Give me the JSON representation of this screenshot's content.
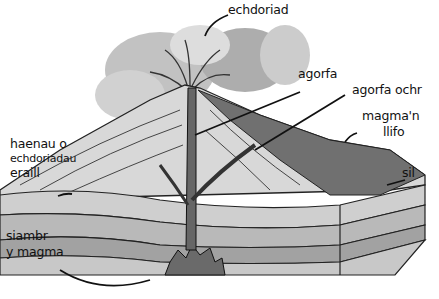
{
  "diagram": {
    "labels": {
      "eruption": "echdoriad",
      "vent": "agorfa",
      "side_vent": "agorfa ochr",
      "flowing_magma_line1": "magma'n",
      "flowing_magma_line2": "llifo",
      "sill": "sil",
      "layers_line1": "haenau o",
      "layers_line2": "echdoriadau",
      "layers_line3": "eraill",
      "chamber_line1": "siambr",
      "chamber_line2": "y magma"
    },
    "colors": {
      "ink": "#111111",
      "ash_cloud": "#9a9a9a",
      "cone_light": "#d6d6d6",
      "lava_flow": "#6e6e6e",
      "strata_light": "#cfcfcf",
      "strata_mid": "#a9a9a9",
      "magma_chamber": "#7a7a7a"
    }
  }
}
